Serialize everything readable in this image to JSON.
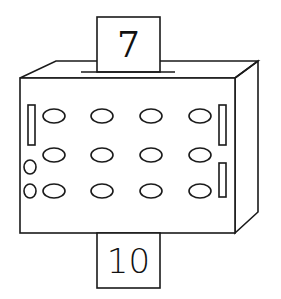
{
  "diagram": {
    "type": "function-machine",
    "input_card": {
      "value": "7"
    },
    "output_card": {
      "value": "10"
    },
    "colors": {
      "stroke": "#1a1a1a",
      "background": "#ffffff"
    },
    "machine": {
      "oval_rows": 3,
      "oval_columns": 4,
      "left_bars": 1,
      "right_bars": 2,
      "small_circles": 2
    }
  }
}
